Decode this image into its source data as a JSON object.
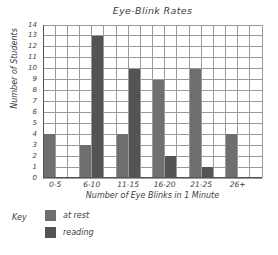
{
  "chart_data": {
    "type": "bar",
    "title": "Eye-Blink Rates",
    "xlabel": "Number of Eye Blinks in 1 Minute",
    "ylabel": "Number of Students",
    "categories": [
      "0-5",
      "6-10",
      "11-15",
      "16-20",
      "21-25",
      "26+"
    ],
    "series": [
      {
        "name": "at rest",
        "color": "#6f6f6f",
        "values": [
          4,
          3,
          4,
          9,
          10,
          4
        ]
      },
      {
        "name": "reading",
        "color": "#545454",
        "values": [
          0,
          13,
          10,
          2,
          1,
          0
        ]
      }
    ],
    "ylim": [
      0,
      14
    ],
    "ytick_step": 1,
    "yticks": [
      "0",
      "1",
      "2",
      "3",
      "4",
      "5",
      "6",
      "7",
      "8",
      "9",
      "10",
      "11",
      "12",
      "13",
      "14"
    ],
    "grid": true,
    "grid_color": "#9a9a9a",
    "axis_color": "#555555",
    "legend_position": "below-left",
    "legend_title": "Key"
  }
}
